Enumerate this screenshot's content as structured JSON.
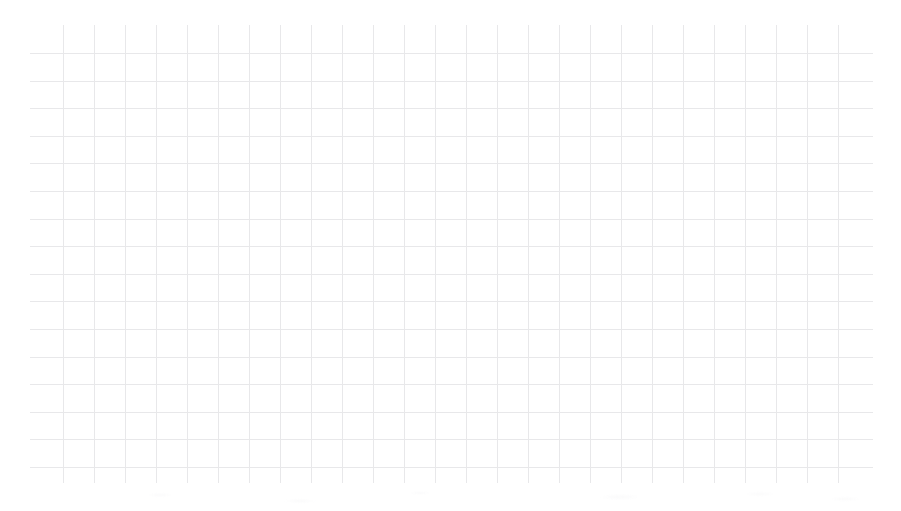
{
  "page": {
    "kind": "blank-grid-background",
    "width": 901,
    "height": 511,
    "background_color": "#ffffff",
    "title": "",
    "has_visible_text": false,
    "notes_text": ""
  },
  "chart_data": {
    "type": "line",
    "title": "",
    "subtitle": "",
    "xlabel": "",
    "ylabel": "",
    "categories": [],
    "x": [],
    "values": [],
    "series": [],
    "annotations": [],
    "legend": {
      "entries": [],
      "position": "none",
      "visible": false
    },
    "axes": {
      "x_tick_labels": [],
      "y_tick_labels": [],
      "xlim": [],
      "ylim": [],
      "x_axis_visible": false,
      "y_axis_visible": false
    },
    "grid": {
      "visible": true,
      "color": "#e8e8ea",
      "line_width_px": 1,
      "vertical_line_count": 26,
      "horizontal_line_count": 17,
      "vertical_spacing_px": 31,
      "horizontal_spacing_px": 27.6,
      "first_vertical_x_px": 33,
      "first_horizontal_y_px": 28,
      "area_left_px": 30,
      "area_top_px": 25,
      "area_width_px": 843,
      "area_height_px": 458
    }
  }
}
